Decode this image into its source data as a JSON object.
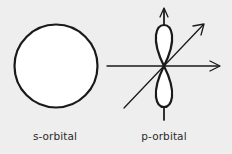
{
  "diagram": {
    "colors": {
      "background": "#eeeeee",
      "stroke": "#1a1a1a",
      "fill": "#ffffff",
      "text": "#2a2a2a"
    },
    "s_orbital": {
      "label": "s-orbital",
      "shape": "sphere"
    },
    "p_orbital": {
      "label": "p-orbital",
      "shape": "dumbbell",
      "axes": [
        "z-axis (vertical, arrow up)",
        "x-axis (horizontal, arrow right)",
        "y-axis (diagonal, arrow upper-right)"
      ]
    }
  }
}
